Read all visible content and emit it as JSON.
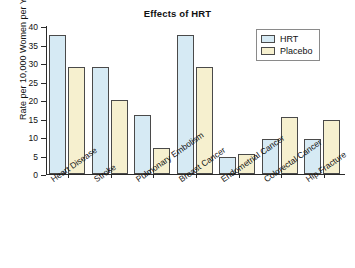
{
  "chart_data": {
    "type": "bar",
    "title": "Effects of HRT",
    "xlabel": "",
    "ylabel": "Rate per 10,000 Women per Year",
    "ylim": [
      0,
      40
    ],
    "yticks": [
      0,
      5,
      10,
      15,
      20,
      25,
      30,
      35,
      40
    ],
    "grid": false,
    "legend_position": "top-right",
    "categories": [
      "Heart Disease",
      "Stroke",
      "Pulmonary Embolism",
      "Breast Cancer",
      "Endometrial Cancer",
      "Colorectal Cancer",
      "Hip Fracture"
    ],
    "series": [
      {
        "name": "HRT",
        "color": "#d6eaf4",
        "values": [
          37.5,
          29,
          16,
          37.5,
          4.5,
          9.5,
          9.5
        ]
      },
      {
        "name": "Placebo",
        "color": "#f6f0cf",
        "values": [
          29,
          20,
          7,
          29,
          5.5,
          15.5,
          14.5
        ]
      }
    ]
  },
  "colors": {
    "hrt": "#d6eaf4",
    "placebo": "#f6f0cf",
    "bar_border": "#4a4a4a",
    "axis": "#2a2a2a",
    "background": "#ffffff"
  }
}
